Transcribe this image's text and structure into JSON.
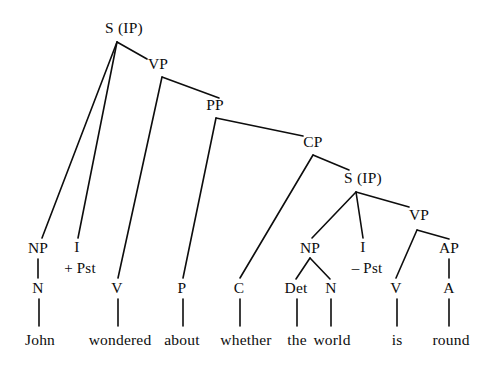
{
  "figure": {
    "type": "syntax-tree-diagram",
    "sentence": "John wondered about whether the world is round",
    "ink_color": "#0d0d0d",
    "background_color": "#ffffff",
    "width": 489,
    "height": 366
  },
  "nodes": [
    {
      "id": "s_root",
      "label": "S (IP)",
      "x": 124,
      "y": 28,
      "kind": "category"
    },
    {
      "id": "vp1",
      "label": "VP",
      "x": 158,
      "y": 64,
      "kind": "category"
    },
    {
      "id": "pp",
      "label": "PP",
      "x": 215,
      "y": 105,
      "kind": "category"
    },
    {
      "id": "cp",
      "label": "CP",
      "x": 313,
      "y": 142,
      "kind": "category"
    },
    {
      "id": "s_embed",
      "label": "S (IP)",
      "x": 363,
      "y": 178,
      "kind": "category"
    },
    {
      "id": "vp2",
      "label": "VP",
      "x": 419,
      "y": 215,
      "kind": "category"
    },
    {
      "id": "np1",
      "label": "NP",
      "x": 38,
      "y": 248,
      "kind": "category"
    },
    {
      "id": "i1",
      "label": "I",
      "x": 77,
      "y": 247,
      "kind": "category"
    },
    {
      "id": "i1_feat",
      "label": "+ Pst",
      "x": 80,
      "y": 268,
      "kind": "feature"
    },
    {
      "id": "np2",
      "label": "NP",
      "x": 310,
      "y": 248,
      "kind": "category"
    },
    {
      "id": "i2",
      "label": "I",
      "x": 363,
      "y": 247,
      "kind": "category"
    },
    {
      "id": "i2_feat",
      "label": "– Pst",
      "x": 367,
      "y": 268,
      "kind": "feature"
    },
    {
      "id": "ap",
      "label": "AP",
      "x": 449,
      "y": 248,
      "kind": "category"
    },
    {
      "id": "n1",
      "label": "N",
      "x": 38,
      "y": 288,
      "kind": "category"
    },
    {
      "id": "v1",
      "label": "V",
      "x": 117,
      "y": 288,
      "kind": "category"
    },
    {
      "id": "p1",
      "label": "P",
      "x": 182,
      "y": 288,
      "kind": "category"
    },
    {
      "id": "c1",
      "label": "C",
      "x": 239,
      "y": 288,
      "kind": "category"
    },
    {
      "id": "det1",
      "label": "Det",
      "x": 296,
      "y": 288,
      "kind": "category"
    },
    {
      "id": "n2",
      "label": "N",
      "x": 331,
      "y": 288,
      "kind": "category"
    },
    {
      "id": "v2",
      "label": "V",
      "x": 396,
      "y": 288,
      "kind": "category"
    },
    {
      "id": "a1",
      "label": "A",
      "x": 449,
      "y": 288,
      "kind": "category"
    }
  ],
  "words": [
    {
      "id": "w_john",
      "label": "John",
      "x": 40,
      "y": 340
    },
    {
      "id": "w_wondered",
      "label": "wondered",
      "x": 120,
      "y": 340
    },
    {
      "id": "w_about",
      "label": "about",
      "x": 182,
      "y": 340
    },
    {
      "id": "w_whether",
      "label": "whether",
      "x": 246,
      "y": 340
    },
    {
      "id": "w_the",
      "label": "the",
      "x": 297,
      "y": 340
    },
    {
      "id": "w_world",
      "label": "world",
      "x": 332,
      "y": 340
    },
    {
      "id": "w_is",
      "label": "is",
      "x": 397,
      "y": 340
    },
    {
      "id": "w_round",
      "label": "round",
      "x": 451,
      "y": 340
    }
  ],
  "edges": [
    {
      "id": "e_s_np1",
      "from": "s_root",
      "to": "np1",
      "x1": 117,
      "y1": 42,
      "x2": 42,
      "y2": 238
    },
    {
      "id": "e_s_i1",
      "from": "s_root",
      "to": "i1",
      "x1": 117,
      "y1": 42,
      "x2": 78,
      "y2": 238
    },
    {
      "id": "e_s_vp1",
      "from": "s_root",
      "to": "vp1",
      "x1": 117,
      "y1": 42,
      "x2": 147,
      "y2": 59
    },
    {
      "id": "e_vp1_v1",
      "from": "vp1",
      "to": "v1",
      "x1": 162,
      "y1": 77,
      "x2": 118,
      "y2": 278
    },
    {
      "id": "e_vp1_pp",
      "from": "vp1",
      "to": "pp",
      "x1": 162,
      "y1": 77,
      "x2": 219,
      "y2": 98
    },
    {
      "id": "e_pp_p1",
      "from": "pp",
      "to": "p1",
      "x1": 216,
      "y1": 118,
      "x2": 183,
      "y2": 278
    },
    {
      "id": "e_pp_cp",
      "from": "pp",
      "to": "cp",
      "x1": 216,
      "y1": 118,
      "x2": 303,
      "y2": 136
    },
    {
      "id": "e_cp_c1",
      "from": "cp",
      "to": "c1",
      "x1": 313,
      "y1": 155,
      "x2": 240,
      "y2": 278
    },
    {
      "id": "e_cp_s2",
      "from": "cp",
      "to": "s_embed",
      "x1": 313,
      "y1": 155,
      "x2": 349,
      "y2": 170
    },
    {
      "id": "e_s2_np2",
      "from": "s_embed",
      "to": "np2",
      "x1": 356,
      "y1": 192,
      "x2": 312,
      "y2": 238
    },
    {
      "id": "e_s2_i2",
      "from": "s_embed",
      "to": "i2",
      "x1": 356,
      "y1": 192,
      "x2": 363,
      "y2": 238
    },
    {
      "id": "e_s2_vp2",
      "from": "s_embed",
      "to": "vp2",
      "x1": 356,
      "y1": 192,
      "x2": 409,
      "y2": 207
    },
    {
      "id": "e_vp2_v2",
      "from": "vp2",
      "to": "v2",
      "x1": 417,
      "y1": 230,
      "x2": 396,
      "y2": 278
    },
    {
      "id": "e_vp2_ap",
      "from": "vp2",
      "to": "ap",
      "x1": 417,
      "y1": 230,
      "x2": 449,
      "y2": 239
    },
    {
      "id": "e_np2_det",
      "from": "np2",
      "to": "det1",
      "x1": 310,
      "y1": 258,
      "x2": 296,
      "y2": 279
    },
    {
      "id": "e_np2_n2",
      "from": "np2",
      "to": "n2",
      "x1": 310,
      "y1": 258,
      "x2": 330,
      "y2": 279
    },
    {
      "id": "e_np1_n1",
      "from": "np1",
      "to": "n1",
      "x1": 38,
      "y1": 259,
      "x2": 38,
      "y2": 278
    },
    {
      "id": "e_ap_a1",
      "from": "ap",
      "to": "a1",
      "x1": 449,
      "y1": 259,
      "x2": 449,
      "y2": 278
    },
    {
      "id": "e_n1_w",
      "from": "n1",
      "to": "w_john",
      "x1": 39,
      "y1": 299,
      "x2": 39,
      "y2": 326
    },
    {
      "id": "e_v1_w",
      "from": "v1",
      "to": "w_wondered",
      "x1": 118,
      "y1": 299,
      "x2": 118,
      "y2": 326
    },
    {
      "id": "e_p1_w",
      "from": "p1",
      "to": "w_about",
      "x1": 183,
      "y1": 299,
      "x2": 183,
      "y2": 326
    },
    {
      "id": "e_c1_w",
      "from": "c1",
      "to": "w_whether",
      "x1": 240,
      "y1": 299,
      "x2": 240,
      "y2": 326
    },
    {
      "id": "e_det_w",
      "from": "det1",
      "to": "w_the",
      "x1": 297,
      "y1": 299,
      "x2": 297,
      "y2": 326
    },
    {
      "id": "e_n2_w",
      "from": "n2",
      "to": "w_world",
      "x1": 331,
      "y1": 299,
      "x2": 331,
      "y2": 326
    },
    {
      "id": "e_v2_w",
      "from": "v2",
      "to": "w_is",
      "x1": 397,
      "y1": 299,
      "x2": 397,
      "y2": 326
    },
    {
      "id": "e_a1_w",
      "from": "a1",
      "to": "w_round",
      "x1": 449,
      "y1": 299,
      "x2": 449,
      "y2": 326
    }
  ]
}
